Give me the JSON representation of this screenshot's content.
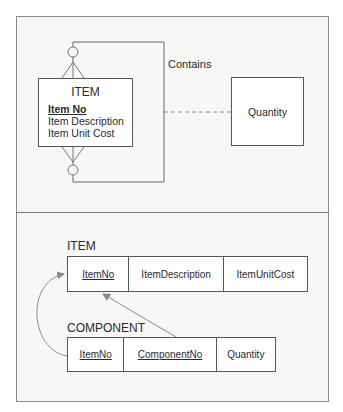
{
  "er_diagram": {
    "entity": {
      "name": "ITEM",
      "attributes": [
        {
          "label": "Item No",
          "primary_key": true
        },
        {
          "label": "Item Description",
          "primary_key": false
        },
        {
          "label": "Item Unit Cost",
          "primary_key": false
        }
      ]
    },
    "relationship": {
      "label": "Contains",
      "type": "recursive many-to-many",
      "associative_attribute": "Quantity"
    }
  },
  "relational_schema": {
    "tables": [
      {
        "name": "ITEM",
        "columns": [
          {
            "label": "ItemNo",
            "key": true
          },
          {
            "label": "ItemDescription",
            "key": false
          },
          {
            "label": "ItemUnitCost",
            "key": false
          }
        ]
      },
      {
        "name": "COMPONENT",
        "columns": [
          {
            "label": "ItemNo",
            "key": true
          },
          {
            "label": "ComponentNo",
            "key": true
          },
          {
            "label": "Quantity",
            "key": false
          }
        ]
      }
    ],
    "foreign_keys": [
      {
        "from": "COMPONENT.ItemNo",
        "to": "ITEM.ItemNo"
      },
      {
        "from": "COMPONENT.ComponentNo",
        "to": "ITEM.ItemNo"
      }
    ]
  },
  "colors": {
    "line": "#555555",
    "arrow": "#8a8a8a",
    "panel_bg": "#f7f7f6"
  }
}
